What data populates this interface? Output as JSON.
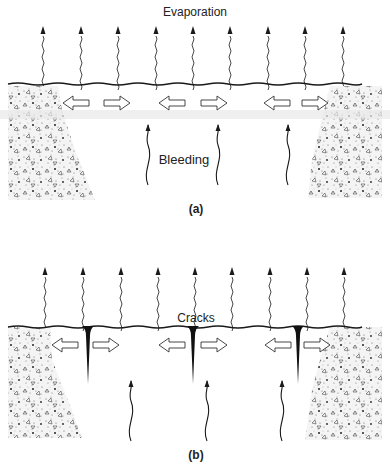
{
  "panels": [
    {
      "id": "a",
      "caption": "(a)",
      "top_label": "Evaporation",
      "inner_label": "Bleeding",
      "evaporation_arrow_count": 9,
      "bleeding_arrow_count": 3,
      "lateral_arrow_pairs": 3,
      "crack_count": 0
    },
    {
      "id": "b",
      "caption": "(b)",
      "top_label": "Cracks",
      "inner_label": "",
      "evaporation_arrow_count": 9,
      "bleeding_arrow_count": 3,
      "lateral_arrow_pairs": 3,
      "crack_count": 3
    }
  ],
  "colors": {
    "ink": "#1a1a1a",
    "stipple": "#555555",
    "background": "#ffffff"
  }
}
